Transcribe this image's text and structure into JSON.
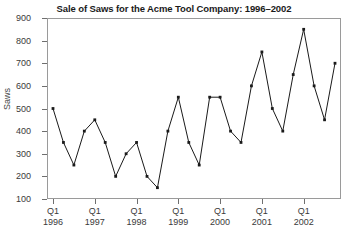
{
  "chart_data": {
    "type": "line",
    "title": "Sale of Saws for the Acme Tool Company: 1996–2002",
    "xlabel": "",
    "ylabel": "Saws",
    "ylim": [
      100,
      900
    ],
    "yticks": [
      100,
      200,
      300,
      400,
      500,
      600,
      700,
      800,
      900
    ],
    "grid": false,
    "legend": false,
    "marker": "filled-square",
    "line_color": "#1a1a1a",
    "x": [
      "1996 Q1",
      "1996 Q2",
      "1996 Q3",
      "1996 Q4",
      "1997 Q1",
      "1997 Q2",
      "1997 Q3",
      "1997 Q4",
      "1998 Q1",
      "1998 Q2",
      "1998 Q3",
      "1998 Q4",
      "1999 Q1",
      "1999 Q2",
      "1999 Q3",
      "1999 Q4",
      "2000 Q1",
      "2000 Q2",
      "2000 Q3",
      "2000 Q4",
      "2001 Q1",
      "2001 Q2",
      "2001 Q3",
      "2001 Q4",
      "2002 Q1",
      "2002 Q2",
      "2002 Q3",
      "2002 Q4"
    ],
    "values": [
      500,
      350,
      250,
      400,
      450,
      350,
      200,
      300,
      350,
      200,
      150,
      400,
      550,
      350,
      250,
      550,
      550,
      400,
      350,
      600,
      750,
      500,
      400,
      650,
      850,
      600,
      450,
      700
    ],
    "xtick_labels": [
      {
        "quarter": "Q1",
        "year": "1996",
        "index": 0
      },
      {
        "quarter": "Q1",
        "year": "1997",
        "index": 4
      },
      {
        "quarter": "Q1",
        "year": "1998",
        "index": 8
      },
      {
        "quarter": "Q1",
        "year": "1999",
        "index": 12
      },
      {
        "quarter": "Q1",
        "year": "2000",
        "index": 16
      },
      {
        "quarter": "Q1",
        "year": "2001",
        "index": 20
      },
      {
        "quarter": "Q1",
        "year": "2002",
        "index": 24
      }
    ]
  }
}
